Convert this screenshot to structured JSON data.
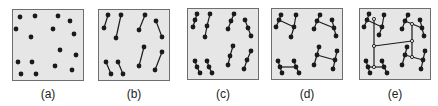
{
  "figure": {
    "panels": [
      {
        "id": "a",
        "label": "(a)",
        "x": 12,
        "y": 9,
        "w": 72,
        "h": 72,
        "nodes": [
          [
            7,
            7
          ],
          [
            22,
            6
          ],
          [
            45,
            6
          ],
          [
            57,
            11
          ],
          [
            3,
            19
          ],
          [
            40,
            19
          ],
          [
            18,
            27
          ],
          [
            61,
            24
          ],
          [
            47,
            40
          ],
          [
            63,
            45
          ],
          [
            5,
            52
          ],
          [
            19,
            52
          ],
          [
            42,
            56
          ],
          [
            59,
            60
          ],
          [
            8,
            64
          ],
          [
            23,
            64
          ]
        ],
        "edges": []
      },
      {
        "id": "b",
        "label": "(b)",
        "x": 98,
        "y": 9,
        "w": 72,
        "h": 72,
        "nodes": [
          [
            9,
            5
          ],
          [
            5,
            18
          ],
          [
            22,
            5
          ],
          [
            17,
            28
          ],
          [
            46,
            5
          ],
          [
            40,
            20
          ],
          [
            57,
            11
          ],
          [
            63,
            27
          ],
          [
            7,
            52
          ],
          [
            12,
            64
          ],
          [
            19,
            52
          ],
          [
            24,
            64
          ],
          [
            45,
            37
          ],
          [
            40,
            56
          ],
          [
            63,
            42
          ],
          [
            56,
            60
          ]
        ],
        "edges": [
          [
            0,
            1
          ],
          [
            2,
            3
          ],
          [
            4,
            5
          ],
          [
            6,
            7
          ],
          [
            8,
            9
          ],
          [
            10,
            11
          ],
          [
            12,
            13
          ],
          [
            14,
            15
          ]
        ]
      },
      {
        "id": "c",
        "label": "(c)",
        "x": 187,
        "y": 8,
        "w": 72,
        "h": 72,
        "nodes": [
          [
            9,
            5
          ],
          [
            7,
            11
          ],
          [
            5,
            18
          ],
          [
            22,
            5
          ],
          [
            19,
            17
          ],
          [
            17,
            28
          ],
          [
            46,
            5
          ],
          [
            43,
            12
          ],
          [
            40,
            20
          ],
          [
            57,
            11
          ],
          [
            60,
            19
          ],
          [
            63,
            27
          ],
          [
            7,
            52
          ],
          [
            9,
            58
          ],
          [
            12,
            64
          ],
          [
            19,
            52
          ],
          [
            21,
            58
          ],
          [
            24,
            64
          ],
          [
            45,
            37
          ],
          [
            42,
            47
          ],
          [
            40,
            56
          ],
          [
            63,
            42
          ],
          [
            59,
            51
          ],
          [
            56,
            60
          ]
        ],
        "edges": [
          [
            0,
            1
          ],
          [
            1,
            2
          ],
          [
            3,
            4
          ],
          [
            4,
            5
          ],
          [
            6,
            7
          ],
          [
            7,
            8
          ],
          [
            9,
            10
          ],
          [
            10,
            11
          ],
          [
            12,
            13
          ],
          [
            13,
            14
          ],
          [
            15,
            16
          ],
          [
            16,
            17
          ],
          [
            18,
            19
          ],
          [
            19,
            20
          ],
          [
            21,
            22
          ],
          [
            22,
            23
          ]
        ]
      },
      {
        "id": "d",
        "label": "(d)",
        "x": 271,
        "y": 8,
        "w": 72,
        "h": 72,
        "nodes": [
          [
            9,
            6
          ],
          [
            7,
            11
          ],
          [
            4,
            18
          ],
          [
            24,
            6
          ],
          [
            22,
            18
          ],
          [
            19,
            28
          ],
          [
            48,
            6
          ],
          [
            45,
            12
          ],
          [
            42,
            20
          ],
          [
            60,
            11
          ],
          [
            62,
            19
          ],
          [
            64,
            27
          ],
          [
            6,
            52
          ],
          [
            8,
            58
          ],
          [
            10,
            64
          ],
          [
            22,
            52
          ],
          [
            24,
            58
          ],
          [
            27,
            64
          ],
          [
            47,
            38
          ],
          [
            45,
            46
          ],
          [
            42,
            56
          ],
          [
            65,
            42
          ],
          [
            63,
            51
          ],
          [
            61,
            60
          ]
        ],
        "edges": [
          [
            0,
            1
          ],
          [
            1,
            2
          ],
          [
            3,
            4
          ],
          [
            4,
            5
          ],
          [
            6,
            7
          ],
          [
            7,
            8
          ],
          [
            9,
            10
          ],
          [
            10,
            11
          ],
          [
            12,
            13
          ],
          [
            13,
            14
          ],
          [
            15,
            16
          ],
          [
            16,
            17
          ],
          [
            18,
            19
          ],
          [
            19,
            20
          ],
          [
            21,
            22
          ],
          [
            22,
            23
          ],
          [
            1,
            4
          ],
          [
            7,
            10
          ],
          [
            13,
            16
          ],
          [
            19,
            22
          ]
        ]
      },
      {
        "id": "e",
        "label": "(e)",
        "x": 359,
        "y": 8,
        "w": 72,
        "h": 72,
        "nodes": [
          [
            9,
            5
          ],
          [
            7,
            11
          ],
          [
            4,
            18
          ],
          [
            24,
            6
          ],
          [
            22,
            18
          ],
          [
            19,
            26
          ],
          [
            48,
            6
          ],
          [
            45,
            12
          ],
          [
            42,
            20
          ],
          [
            60,
            11
          ],
          [
            62,
            19
          ],
          [
            64,
            27
          ],
          [
            6,
            52
          ],
          [
            8,
            58
          ],
          [
            10,
            64
          ],
          [
            22,
            52
          ],
          [
            24,
            58
          ],
          [
            27,
            64
          ],
          [
            47,
            38
          ],
          [
            45,
            46
          ],
          [
            42,
            56
          ],
          [
            65,
            42
          ],
          [
            63,
            51
          ],
          [
            61,
            60
          ],
          [
            14,
            10
          ],
          [
            14,
            37
          ],
          [
            14,
            58
          ],
          [
            52,
            15
          ],
          [
            52,
            32
          ],
          [
            52,
            48
          ]
        ],
        "edges": [
          [
            0,
            1
          ],
          [
            1,
            2
          ],
          [
            3,
            4
          ],
          [
            4,
            5
          ],
          [
            6,
            7
          ],
          [
            7,
            8
          ],
          [
            9,
            10
          ],
          [
            10,
            11
          ],
          [
            12,
            13
          ],
          [
            13,
            14
          ],
          [
            15,
            16
          ],
          [
            16,
            17
          ],
          [
            18,
            19
          ],
          [
            19,
            20
          ],
          [
            21,
            22
          ],
          [
            22,
            23
          ],
          [
            1,
            4
          ],
          [
            7,
            10
          ],
          [
            13,
            16
          ],
          [
            19,
            22
          ],
          [
            24,
            25
          ],
          [
            25,
            26
          ],
          [
            27,
            28
          ],
          [
            28,
            29
          ],
          [
            25,
            28
          ]
        ]
      }
    ],
    "colors": {
      "panel_fill": "#e6e6e6",
      "panel_border": "#6e6e6e",
      "node": "#1a1a1a",
      "edge": "#1a1a1a",
      "label": "#222222"
    }
  }
}
